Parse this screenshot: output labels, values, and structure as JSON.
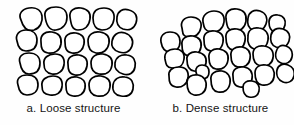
{
  "figure": {
    "background_color": "#fefefe",
    "stroke_color": "#000000",
    "grain_fill_color": "#ffffff",
    "text_color": "#141414"
  },
  "panels": [
    {
      "id": "loose",
      "caption": "a. Loose structure",
      "label_letter": "a.",
      "label_text": "Loose structure",
      "grain_count": 20,
      "description": "loose-packing-soil-grains"
    },
    {
      "id": "dense",
      "caption": "b. Dense structure",
      "label_letter": "b.",
      "label_text": "Dense structure",
      "grain_count": 28,
      "description": "dense-packing-soil-grains"
    }
  ]
}
